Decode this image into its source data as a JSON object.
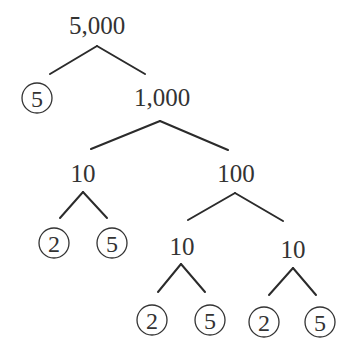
{
  "diagram": {
    "type": "factor-tree",
    "root": "5,000",
    "nodes": {
      "n_5000": {
        "label": "5,000",
        "prime": false
      },
      "n_5a": {
        "label": "5",
        "prime": true
      },
      "n_1000": {
        "label": "1,000",
        "prime": false
      },
      "n_10a": {
        "label": "10",
        "prime": false
      },
      "n_100": {
        "label": "100",
        "prime": false
      },
      "n_2a": {
        "label": "2",
        "prime": true
      },
      "n_5b": {
        "label": "5",
        "prime": true
      },
      "n_10b": {
        "label": "10",
        "prime": false
      },
      "n_10c": {
        "label": "10",
        "prime": false
      },
      "n_2b": {
        "label": "2",
        "prime": true
      },
      "n_5c": {
        "label": "5",
        "prime": true
      },
      "n_2c": {
        "label": "2",
        "prime": true
      },
      "n_5d": {
        "label": "5",
        "prime": true
      }
    },
    "edges": [
      [
        "5,000",
        "5"
      ],
      [
        "5,000",
        "1,000"
      ],
      [
        "1,000",
        "10"
      ],
      [
        "1,000",
        "100"
      ],
      [
        "10",
        "2"
      ],
      [
        "10",
        "5"
      ],
      [
        "100",
        "10"
      ],
      [
        "100",
        "10"
      ],
      [
        "10",
        "2"
      ],
      [
        "10",
        "5"
      ],
      [
        "10",
        "2"
      ],
      [
        "10",
        "5"
      ]
    ],
    "prime_factors": [
      "5",
      "2",
      "5",
      "2",
      "5",
      "2",
      "5"
    ],
    "colors": {
      "line": "#2b2b2b",
      "text": "#333333",
      "background": "#ffffff"
    }
  }
}
